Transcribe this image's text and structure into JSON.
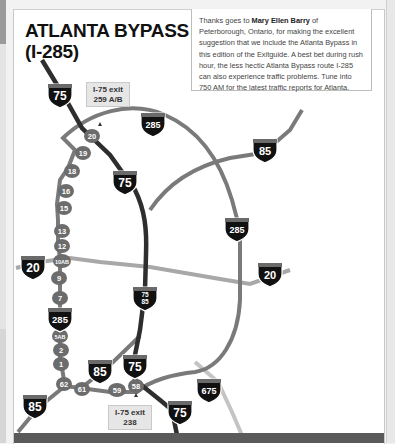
{
  "title": {
    "line1": "ATLANTA BYPASS",
    "line2": "(I-285)"
  },
  "note": {
    "prefix": "Thanks goes to ",
    "name": "Mary Ellen Barry",
    "suffix": " of Peterborough, Ontario, for making the excellent suggestion that we include the Atlanta Bypass in this edition of the Exitguide. A best bet during rush hour, the less hectic Atlanta Bypass route I-285 can also experience traffic problems. Tune into 750 AM for the latest traffic reports for Atlanta."
  },
  "exit_labels": {
    "north": {
      "line1": "I-75  exit",
      "line2": "259 A/B"
    },
    "south": {
      "line1": "I-75  exit",
      "line2": "238"
    }
  },
  "shields": {
    "i75_north": "75",
    "i75_mid": "75",
    "i285_top": "285",
    "i85_ne": "85",
    "i285_east": "285",
    "i20_west": "20",
    "i20_east": "20",
    "i75_85": "75\n85",
    "i285_west": "285",
    "i85_sw": "85",
    "i85_south": "85",
    "i75_south": "75",
    "i75_bottom": "75",
    "i675": "675"
  },
  "exits": [
    "20",
    "19",
    "18",
    "16",
    "15",
    "13",
    "12",
    "10AB",
    "9",
    "7",
    "5AB",
    "2",
    "1",
    "62",
    "61",
    "59",
    "58"
  ],
  "colors": {
    "i285_route": "#7a7a7a",
    "i75_route": "#2e2e2e",
    "i20_route": "#a8a8a8",
    "i675_route": "#c4c4c4",
    "exit_marker": "#6c6c6c",
    "shield": "#111111",
    "shield_top": "#6a6a6a"
  }
}
